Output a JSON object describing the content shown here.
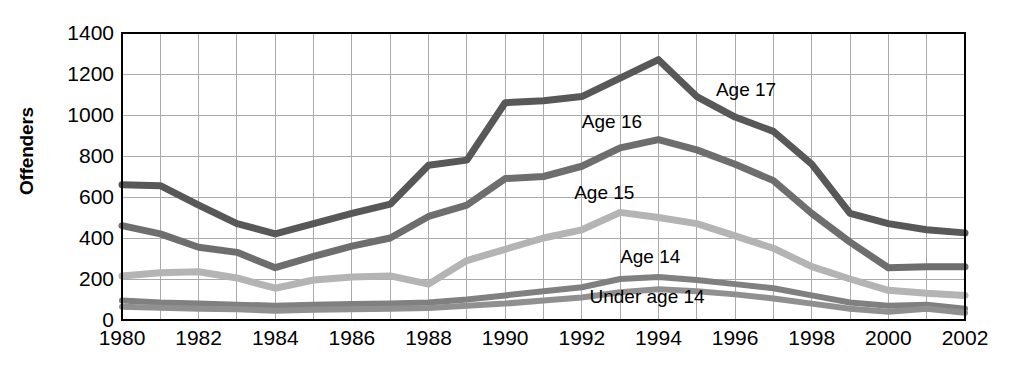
{
  "chart_data": {
    "type": "line",
    "title": "",
    "subtitle": "",
    "xlabel": "",
    "ylabel": "Offenders",
    "xlim": [
      1980,
      2002
    ],
    "ylim": [
      0,
      1400
    ],
    "ytick_values": [
      0,
      200,
      400,
      600,
      800,
      1000,
      1200,
      1400
    ],
    "ytick_labels": [
      "0",
      "200",
      "400",
      "600",
      "800",
      "1000",
      "1200",
      "1400"
    ],
    "xtick_values": [
      1980,
      1982,
      1984,
      1986,
      1988,
      1990,
      1992,
      1994,
      1996,
      1998,
      2000,
      2002
    ],
    "xtick_labels": [
      "1980",
      "1982",
      "1984",
      "1986",
      "1988",
      "1990",
      "1992",
      "1994",
      "1996",
      "1998",
      "2000",
      "2002"
    ],
    "grid": true,
    "grid_x_step": 1,
    "grid_y_step": 200,
    "legend_position": "inline-annotations",
    "x": [
      1980,
      1981,
      1982,
      1983,
      1984,
      1985,
      1986,
      1987,
      1988,
      1989,
      1990,
      1991,
      1992,
      1993,
      1994,
      1995,
      1996,
      1997,
      1998,
      1999,
      2000,
      2001,
      2002
    ],
    "series": [
      {
        "name": "Age 17",
        "color": "#585858",
        "width": 7,
        "values": [
          660,
          655,
          560,
          470,
          420,
          470,
          520,
          565,
          755,
          780,
          1060,
          1070,
          1090,
          1180,
          1270,
          1090,
          990,
          920,
          760,
          520,
          470,
          440,
          425
        ]
      },
      {
        "name": "Age 16",
        "color": "#6e6e6e",
        "width": 7,
        "values": [
          460,
          420,
          355,
          330,
          255,
          310,
          360,
          400,
          505,
          560,
          690,
          700,
          750,
          840,
          880,
          830,
          760,
          680,
          520,
          380,
          255,
          260,
          260
        ]
      },
      {
        "name": "Age 15",
        "color": "#b4b4b4",
        "width": 7,
        "values": [
          215,
          230,
          235,
          205,
          155,
          195,
          210,
          215,
          175,
          290,
          345,
          400,
          440,
          525,
          500,
          470,
          410,
          350,
          260,
          200,
          145,
          130,
          120
        ]
      },
      {
        "name": "Age 14",
        "color": "#808080",
        "width": 6,
        "values": [
          95,
          85,
          80,
          75,
          70,
          75,
          78,
          80,
          85,
          100,
          120,
          140,
          160,
          200,
          210,
          195,
          175,
          155,
          120,
          85,
          70,
          75,
          55
        ]
      },
      {
        "name": "Under age 14",
        "color": "#909090",
        "width": 6,
        "values": [
          65,
          60,
          55,
          52,
          45,
          50,
          52,
          55,
          58,
          70,
          80,
          95,
          110,
          135,
          150,
          140,
          125,
          105,
          80,
          55,
          40,
          55,
          35
        ]
      }
    ],
    "annotations": [
      {
        "text": "Age 17",
        "x": 1995.5,
        "y": 1120
      },
      {
        "text": "Age 16",
        "x": 1992.0,
        "y": 965
      },
      {
        "text": "Age 15",
        "x": 1991.8,
        "y": 620
      },
      {
        "text": "Age 14",
        "x": 1993.0,
        "y": 305
      },
      {
        "text": "Under age 14",
        "x": 1992.2,
        "y": 110
      }
    ]
  },
  "style": {
    "axis_color": "#000000",
    "grid_color": "#aaaaaa",
    "background": "#ffffff",
    "text_color": "#000000"
  }
}
